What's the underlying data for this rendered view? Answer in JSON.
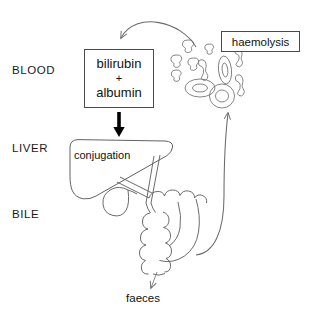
{
  "diagram": {
    "background_color": "#ffffff",
    "stroke_color": "#555555",
    "text_color": "#111111"
  },
  "compartments": [
    {
      "id": "blood",
      "label": "BLOOD"
    },
    {
      "id": "liver",
      "label": "LIVER"
    },
    {
      "id": "bile",
      "label": "BILE"
    }
  ],
  "nodes": {
    "bilirubin_albumin": {
      "line1": "bilirubin",
      "operator": "+",
      "line2": "albumin"
    },
    "haemolysis": {
      "label": "haemolysis"
    },
    "liver_organ": {
      "label": "conjugation"
    },
    "faeces": {
      "label": "faeces"
    }
  },
  "arrows": [
    {
      "id": "haemolysis-to-bilirubin",
      "from": "red-blood-cell-fragments",
      "to": "bilirubin-albumin-box",
      "style": "thin-curved",
      "direction": "right-to-left-downward"
    },
    {
      "id": "bilirubin-to-liver",
      "from": "bilirubin-albumin-box",
      "to": "liver",
      "style": "thick-solid",
      "direction": "down"
    },
    {
      "id": "intestine-to-blood",
      "from": "intestine",
      "to": "red-blood-cells",
      "style": "thin-curved-long",
      "direction": "upward"
    },
    {
      "id": "intestine-to-faeces",
      "from": "intestine",
      "to": "faeces",
      "style": "thin-solid",
      "direction": "down"
    }
  ],
  "anatomy": [
    {
      "id": "liver-organ",
      "shape": "rounded-wedge"
    },
    {
      "id": "gallbladder",
      "shape": "pear"
    },
    {
      "id": "bile-duct",
      "shape": "y-branch"
    },
    {
      "id": "intestine",
      "shape": "scalloped-tube"
    },
    {
      "id": "red-blood-cells",
      "shape": "concentric-ovals",
      "count": 4
    },
    {
      "id": "cell-fragments",
      "shape": "irregular-teardrops",
      "count": 5
    },
    {
      "id": "cell-dumbbells",
      "shape": "dumbbell",
      "count": 3
    }
  ]
}
